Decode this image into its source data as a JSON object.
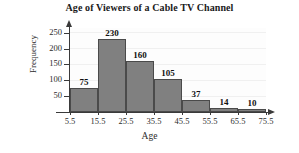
{
  "chart_data": {
    "type": "bar",
    "title": "Age of Viewers of a Cable TV Channel",
    "xlabel": "Age",
    "ylabel": "Frequency",
    "categories": [
      "5.5",
      "15.5",
      "25.5",
      "35.5",
      "45.5",
      "55.5",
      "65.5"
    ],
    "values": [
      75,
      230,
      160,
      105,
      37,
      14,
      10
    ],
    "bar_labels": [
      "75",
      "230",
      "160",
      "105",
      "37",
      "14",
      "10"
    ],
    "x_tick_labels": [
      "5.5",
      "15.5",
      "25.5",
      "35.5",
      "45.5",
      "55.5",
      "65.5",
      "75.5"
    ],
    "x_tick_values": [
      5.5,
      15.5,
      25.5,
      35.5,
      45.5,
      55.5,
      65.5,
      75.5
    ],
    "y_tick_labels": [
      "50",
      "100",
      "150",
      "200",
      "250"
    ],
    "y_tick_values": [
      50,
      100,
      150,
      200,
      250
    ],
    "ylim": [
      0,
      265
    ],
    "xlim": [
      5.5,
      75.5
    ],
    "grid": true,
    "legend": "none",
    "bar_color": "#808080",
    "bar_edge_color": "#4a4a4a",
    "axis_color": "#3a3a3a",
    "text_color": "#1a1a1a",
    "background_color": "#ffffff",
    "plot_background_color": "#fdfdfd",
    "gridline_color": "#f0f0f0",
    "bin_width": 10
  }
}
